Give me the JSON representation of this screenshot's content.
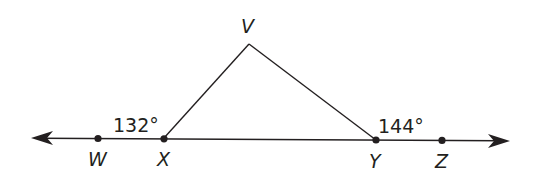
{
  "diagram": {
    "type": "geometry-triangle-exterior-angles",
    "line_color": "#231f20",
    "points": {
      "V": {
        "label": "V",
        "x": 249,
        "y": 44
      },
      "W": {
        "label": "W",
        "x": 98,
        "y": 138
      },
      "X": {
        "label": "X",
        "x": 164,
        "y": 138
      },
      "Y": {
        "label": "Y",
        "x": 376,
        "y": 140
      },
      "Z": {
        "label": "Z",
        "x": 442,
        "y": 140
      }
    },
    "line": {
      "from_arrow": {
        "x": 31,
        "y": 138
      },
      "to_arrow": {
        "x": 510,
        "y": 141
      }
    },
    "angles": [
      {
        "vertex": "X",
        "label": "132°"
      },
      {
        "vertex": "Y",
        "label": "144°"
      }
    ]
  }
}
